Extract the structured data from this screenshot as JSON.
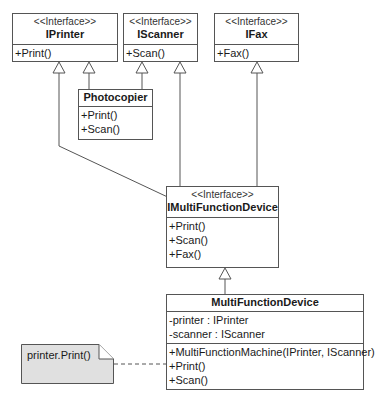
{
  "diagram": {
    "type": "UML class diagram",
    "classes": {
      "iprinter": {
        "stereotype": "<<Interface>>",
        "name": "IPrinter",
        "attributes": [],
        "operations": [
          "+Print()"
        ]
      },
      "iscanner": {
        "stereotype": "<<Interface>>",
        "name": "IScanner",
        "attributes": [],
        "operations": [
          "+Scan()"
        ]
      },
      "ifax": {
        "stereotype": "<<Interface>>",
        "name": "IFax",
        "attributes": [],
        "operations": [
          "+Fax()"
        ]
      },
      "photocopier": {
        "stereotype": "",
        "name": "Photocopier",
        "attributes": [],
        "operations": [
          "+Print()",
          "+Scan()"
        ]
      },
      "imfd": {
        "stereotype": "<<Interface>>",
        "name": "IMultiFunctionDevice",
        "attributes": [],
        "operations": [
          "+Print()",
          "+Scan()",
          "+Fax()"
        ]
      },
      "mfd": {
        "stereotype": "",
        "name": "MultiFunctionDevice",
        "attributes": [
          "-printer : IPrinter",
          "-scanner : IScanner"
        ],
        "operations": [
          "+MultiFunctionMachine(IPrinter, IScanner)",
          "+Print()",
          "+Scan()"
        ]
      }
    },
    "relationships": [
      {
        "type": "realization",
        "from": "Photocopier",
        "to": "IPrinter"
      },
      {
        "type": "realization",
        "from": "Photocopier",
        "to": "IScanner"
      },
      {
        "type": "generalization",
        "from": "IMultiFunctionDevice",
        "to": "IPrinter"
      },
      {
        "type": "generalization",
        "from": "IMultiFunctionDevice",
        "to": "IScanner"
      },
      {
        "type": "generalization",
        "from": "IMultiFunctionDevice",
        "to": "IFax"
      },
      {
        "type": "realization",
        "from": "MultiFunctionDevice",
        "to": "IMultiFunctionDevice"
      },
      {
        "type": "note-anchor",
        "from": "note",
        "to": "MultiFunctionDevice.Print()"
      }
    ],
    "note": {
      "text": "printer.Print()"
    },
    "colors": {
      "line": "#555555",
      "note_fill": "#e0e0e0",
      "box_fill": "#ffffff"
    }
  }
}
